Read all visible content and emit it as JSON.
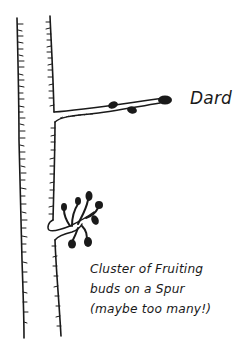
{
  "diagram": {
    "type": "botanical-sketch",
    "colors": {
      "ink": "#1a1a1a",
      "background": "#ffffff"
    },
    "labels": {
      "dard": "Dard",
      "caption_lines": [
        "Cluster of Fruiting",
        "buds on a Spur",
        "(maybe too many!)"
      ]
    },
    "elements": [
      {
        "name": "main-branch",
        "description": "Vertical branch with bark hatching"
      },
      {
        "name": "dard-shoot",
        "description": "Horizontal short shoot with buds, labelled Dard"
      },
      {
        "name": "fruiting-spur",
        "description": "Cluster of fruiting buds on a spur"
      }
    ]
  }
}
